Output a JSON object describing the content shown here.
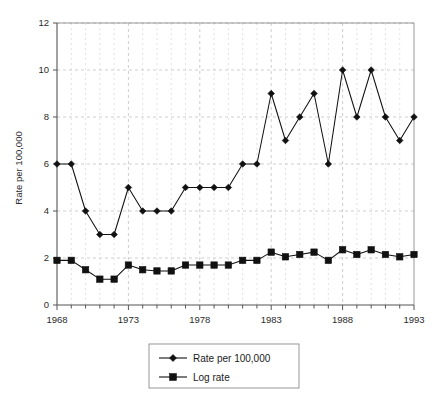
{
  "chart_data": {
    "type": "line",
    "title": "",
    "xlabel": "",
    "ylabel": "Rate per 100,000",
    "xlim": [
      1968,
      1993
    ],
    "ylim": [
      0,
      12
    ],
    "ytick_labels": [
      "0",
      "2",
      "4",
      "6",
      "8",
      "10",
      "12"
    ],
    "yticks": [
      0,
      2,
      4,
      6,
      8,
      10,
      12
    ],
    "xtick_labels": [
      "1968",
      "1973",
      "1978",
      "1983",
      "1988",
      "1993"
    ],
    "xticks": [
      1968,
      1973,
      1978,
      1983,
      1988,
      1993
    ],
    "x": [
      1968,
      1969,
      1970,
      1971,
      1972,
      1973,
      1974,
      1975,
      1976,
      1977,
      1978,
      1979,
      1980,
      1981,
      1982,
      1983,
      1984,
      1985,
      1986,
      1987,
      1988,
      1989,
      1990,
      1991,
      1992,
      1993
    ],
    "grid": true,
    "grid_minor": true,
    "legend_position": "bottom-center",
    "series": [
      {
        "name": "Rate per 100,000",
        "marker": "diamond",
        "values": [
          6,
          6,
          4,
          3,
          3,
          5,
          4,
          4,
          4,
          5,
          5,
          5,
          5,
          6,
          6,
          9,
          7,
          8,
          9,
          6,
          10,
          8,
          10,
          8,
          7,
          8
        ]
      },
      {
        "name": "Log rate",
        "marker": "square",
        "values": [
          1.9,
          1.9,
          1.5,
          1.1,
          1.1,
          1.7,
          1.5,
          1.45,
          1.45,
          1.7,
          1.7,
          1.7,
          1.7,
          1.9,
          1.9,
          2.25,
          2.05,
          2.15,
          2.25,
          1.9,
          2.35,
          2.15,
          2.35,
          2.15,
          2.05,
          2.15
        ]
      }
    ]
  },
  "legend": {
    "entries": [
      {
        "label": "Rate per 100,000",
        "marker": "diamond"
      },
      {
        "label": "Log rate",
        "marker": "square"
      }
    ]
  },
  "axes": {
    "y_title": "Rate per 100,000"
  },
  "colors": {
    "series": "#111111",
    "grid": "#b9b9b9",
    "grid_minor": "#cfcfcf",
    "axis": "#555555",
    "frame": "#8c8c8c",
    "text": "#2b2b2b",
    "background": "#ffffff"
  }
}
